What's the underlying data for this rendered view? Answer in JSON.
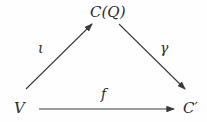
{
  "nodes": {
    "top": "C(Q)",
    "left": "V",
    "right": "C′"
  },
  "arrows": {
    "left_up": "ι",
    "right_down": "γ",
    "bottom": "f"
  },
  "colors": {
    "stroke": "#3a3a3a",
    "text": "#2a2a2a"
  }
}
